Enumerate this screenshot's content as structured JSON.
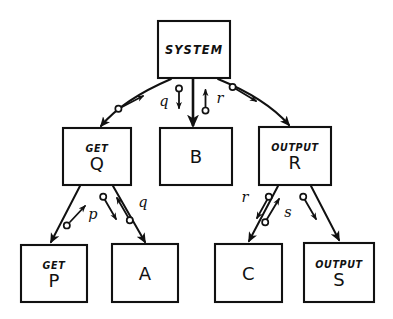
{
  "diagram": {
    "style": "hand-drawn",
    "background_color": "#ffffff",
    "ink_color": "#111111",
    "nodes": [
      {
        "id": "system",
        "kind": "",
        "name": "SYSTEM",
        "single_line": true,
        "x": 158,
        "y": 21,
        "w": 72,
        "h": 57
      },
      {
        "id": "get_q",
        "kind": "GET",
        "name": "Q",
        "single_line": false,
        "x": 63,
        "y": 128,
        "w": 68,
        "h": 57
      },
      {
        "id": "b",
        "kind": "",
        "name": "B",
        "single_line": true,
        "x": 160,
        "y": 128,
        "w": 72,
        "h": 57
      },
      {
        "id": "out_r",
        "kind": "OUTPUT",
        "name": "R",
        "single_line": false,
        "x": 259,
        "y": 127,
        "w": 72,
        "h": 58
      },
      {
        "id": "get_p",
        "kind": "GET",
        "name": "P",
        "single_line": false,
        "x": 21,
        "y": 245,
        "w": 66,
        "h": 57
      },
      {
        "id": "a",
        "kind": "",
        "name": "A",
        "single_line": true,
        "x": 112,
        "y": 244,
        "w": 66,
        "h": 58
      },
      {
        "id": "c",
        "kind": "",
        "name": "C",
        "single_line": true,
        "x": 215,
        "y": 244,
        "w": 67,
        "h": 58
      },
      {
        "id": "out_s",
        "kind": "OUTPUT",
        "name": "S",
        "single_line": false,
        "x": 304,
        "y": 243,
        "w": 70,
        "h": 59
      }
    ],
    "edges": [
      {
        "id": "system-to-getq",
        "from": "system",
        "to": "get_q",
        "label": "q",
        "shape": "curve-left",
        "has_return_pin": true
      },
      {
        "id": "system-to-b",
        "from": "system",
        "to": "b",
        "label": "",
        "shape": "straight",
        "has_return_pin": true
      },
      {
        "id": "system-to-outr",
        "from": "system",
        "to": "out_r",
        "label": "r",
        "shape": "curve-right",
        "has_return_pin": true
      },
      {
        "id": "getq-to-getp",
        "from": "get_q",
        "to": "get_p",
        "label": "p",
        "shape": "straight",
        "has_return_pin": true
      },
      {
        "id": "getq-to-a",
        "from": "get_q",
        "to": "a",
        "label": "q",
        "shape": "straight",
        "has_return_pin": true
      },
      {
        "id": "outr-to-c",
        "from": "out_r",
        "to": "c",
        "label": "r",
        "shape": "straight",
        "has_return_pin": true
      },
      {
        "id": "outr-to-outs",
        "from": "out_r",
        "to": "out_s",
        "label": "s",
        "shape": "straight",
        "has_return_pin": true
      }
    ],
    "edge_labels": {
      "q_top": "q",
      "r_top": "r",
      "p_left": "p",
      "q_left": "q",
      "r_right": "r",
      "s_right": "s"
    }
  }
}
